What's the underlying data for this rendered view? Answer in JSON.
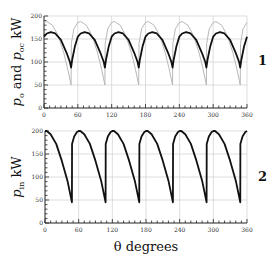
{
  "chart_data": [
    {
      "type": "line",
      "panel_label": "1",
      "title": "",
      "xlabel": "",
      "ylabel": "p_o and p_oc kW",
      "ylabel_parts": {
        "p1": "p",
        "s1": "o",
        "and": " and ",
        "p2": "p",
        "s2": "oc",
        "unit": " kW"
      },
      "xlim": [
        0,
        360
      ],
      "ylim": [
        0,
        200
      ],
      "xticks": [
        0,
        60,
        120,
        180,
        240,
        300,
        360
      ],
      "yticks": [
        0,
        50,
        100,
        150,
        200
      ],
      "grid": true,
      "period_deg": 60,
      "series": [
        {
          "name": "p_o",
          "color": "#b8b8b8",
          "description": "periodic, peak ~188 kW near 5° after cusp, minimum ~50 kW at cusp (48°+60k)",
          "x": [
            0,
            5,
            15,
            25,
            35,
            42,
            48,
            48.5,
            53,
            60
          ],
          "values": [
            186,
            188,
            180,
            158,
            120,
            85,
            50,
            140,
            172,
            186
          ]
        },
        {
          "name": "p_oc",
          "color": "#111111",
          "description": "periodic, peak ~165 kW, cusp minimum ~90 kW at 48°+60k",
          "x": [
            0,
            5,
            12,
            20,
            30,
            40,
            46,
            48,
            50,
            55,
            60
          ],
          "values": [
            155,
            162,
            165,
            162,
            148,
            120,
            100,
            88,
            105,
            135,
            155
          ]
        }
      ]
    },
    {
      "type": "line",
      "panel_label": "2",
      "title": "",
      "xlabel": "θ degrees",
      "ylabel": "p_in kW",
      "ylabel_parts": {
        "p1": "p",
        "s1": "in",
        "unit": " kW"
      },
      "xlim": [
        0,
        360
      ],
      "ylim": [
        0,
        200
      ],
      "xticks": [
        0,
        60,
        120,
        180,
        240,
        300,
        360
      ],
      "yticks": [
        0,
        50,
        100,
        150,
        200
      ],
      "grid": true,
      "period_deg": 60,
      "series": [
        {
          "name": "p_in",
          "color": "#111111",
          "description": "periodic sawtooth-like, max 200 kW, falls to ~45 kW at 48°+60k then jumps to ~172 kW",
          "x": [
            0,
            3,
            10,
            20,
            30,
            40,
            48,
            48.2,
            52,
            57,
            60
          ],
          "values": [
            200,
            200,
            193,
            172,
            135,
            92,
            45,
            172,
            188,
            198,
            200
          ]
        }
      ]
    }
  ]
}
